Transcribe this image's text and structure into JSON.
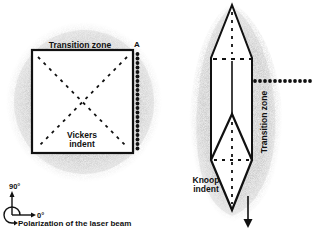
{
  "vickers": {
    "top_label": "Transition zone",
    "corner_label": "A",
    "indent_label_line1": "Vickers",
    "indent_label_line2": "indent"
  },
  "knoop": {
    "side_label": "Transition zone",
    "indent_label_line1": "Knoop",
    "indent_label_line2": "indent"
  },
  "polarization": {
    "angle_90": "90°",
    "angle_0": "0°",
    "caption": "Polarization of the laser beam"
  },
  "colors": {
    "stroke": "#111111",
    "halo": "#b8b8b8",
    "background": "#ffffff"
  }
}
